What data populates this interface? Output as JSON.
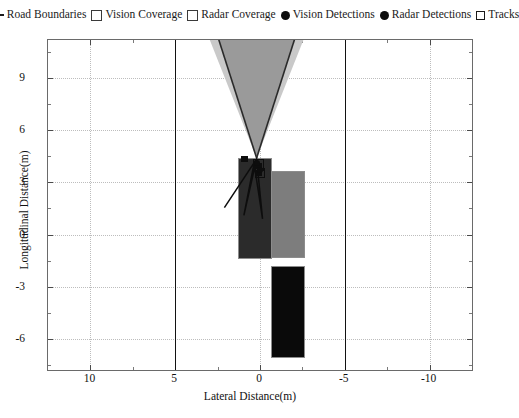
{
  "legend": {
    "items": [
      {
        "marker": "line",
        "icon": "road-boundary-line-icon",
        "label": "Road Boundaries"
      },
      {
        "marker": "square",
        "icon": "vision-coverage-swatch-icon",
        "label": "Vision Coverage"
      },
      {
        "marker": "square",
        "icon": "radar-coverage-swatch-icon",
        "label": "Radar Coverage"
      },
      {
        "marker": "dot",
        "icon": "vision-detection-dot-icon",
        "label": "Vision Detections"
      },
      {
        "marker": "dot",
        "icon": "radar-detection-dot-icon",
        "label": "Radar Detections"
      },
      {
        "marker": "tinysquare",
        "icon": "track-box-icon",
        "label": "Tracks"
      }
    ]
  },
  "axes": {
    "x_title": "Lateral Distance(m)",
    "y_title": "Longitudinal Distance(m)",
    "x_ticks": [
      "10",
      "5",
      "0",
      "-5",
      "-10"
    ],
    "x_tick_values": [
      10,
      5,
      0,
      -5,
      -10
    ],
    "y_ticks": [
      "9",
      "6",
      "3",
      "0",
      "-3",
      "-6"
    ],
    "y_tick_values": [
      9,
      6,
      3,
      0,
      -3,
      -6
    ],
    "xlim": [
      12.5,
      -12.5
    ],
    "ylim": [
      -7.8,
      11.2
    ],
    "x_inverted": true,
    "grid": "dotted"
  },
  "colors": {
    "ego_vehicle": "#2b2b2b",
    "target_vehicle_gray": "#7d7d7d",
    "target_vehicle_black": "#0a0a0a",
    "vision_coverage": "#9a9a9a",
    "radar_coverage": "#c9c9c9",
    "road_boundary": "#121212",
    "grid": "#bdbdbd",
    "frame": "#6a6a6a",
    "detection": "#0d0d0d",
    "track": "#0d0d0d"
  },
  "chart_data": {
    "type": "scatter",
    "title": "",
    "xlabel": "Lateral Distance(m)",
    "ylabel": "Longitudinal Distance(m)",
    "xlim": [
      12.5,
      -12.5
    ],
    "ylim": [
      -7.8,
      11.2
    ],
    "grid": true,
    "legend_position": "top",
    "road_boundaries": [
      {
        "name": "left-boundary",
        "x": 5.0
      },
      {
        "name": "right-boundary",
        "x": -5.0
      }
    ],
    "coverage_cones": [
      {
        "name": "radar-coverage",
        "apex": [
          0.2,
          4.4
        ],
        "half_angle_deg": 10.5,
        "range_m": 11.0,
        "fill": "#c9c9c9"
      },
      {
        "name": "vision-coverage",
        "apex": [
          0.2,
          4.4
        ],
        "half_angle_deg": 8.5,
        "range_m": 11.0,
        "fill": "#9a9a9a"
      }
    ],
    "vehicles": [
      {
        "name": "ego-vehicle",
        "x": 0.35,
        "y": 1.55,
        "width": 1.9,
        "length": 5.7,
        "fill": "#2b2b2b"
      },
      {
        "name": "target-vehicle-right",
        "x": -1.6,
        "y": 1.2,
        "width": 1.9,
        "length": 4.9,
        "fill": "#7d7d7d"
      },
      {
        "name": "target-vehicle-rear",
        "x": -1.6,
        "y": -4.4,
        "width": 1.9,
        "length": 5.2,
        "fill": "#0a0a0a"
      }
    ],
    "vision_detections": [
      {
        "x": 0.9,
        "y": 4.35
      },
      {
        "x": 0.1,
        "y": 3.95
      },
      {
        "x": 0.05,
        "y": 3.55
      }
    ],
    "radar_detections": [
      {
        "x": 0.15,
        "y": 4.1
      },
      {
        "x": 0.0,
        "y": 3.7
      }
    ],
    "tracks": [
      {
        "x": 0.15,
        "y": 4.05,
        "w": 0.55,
        "h": 0.55
      },
      {
        "x": 0.05,
        "y": 3.6,
        "w": 0.5,
        "h": 0.5
      }
    ]
  }
}
